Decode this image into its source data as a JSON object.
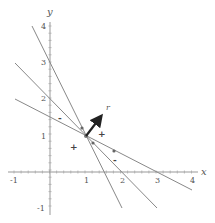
{
  "diagram": {
    "type": "coordinate-plane",
    "axes": {
      "x_label": "x",
      "y_label": "y",
      "x_ticks": [
        "-1",
        "1",
        "2",
        "3",
        "4"
      ],
      "y_ticks": [
        "4",
        "3",
        "2",
        "1",
        "-1"
      ],
      "xlim": [
        -1,
        4
      ],
      "ylim": [
        -1,
        4
      ]
    },
    "lines": [
      {
        "name": "steep-line",
        "from": [
          -0.5,
          4
        ],
        "to": [
          2,
          -1
        ],
        "color": "#888888"
      },
      {
        "name": "middle-line",
        "from": [
          -1,
          3
        ],
        "to": [
          3,
          -1
        ],
        "color": "#888888"
      },
      {
        "name": "shallow-line",
        "from": [
          -1,
          2
        ],
        "to": [
          4,
          -0.5
        ],
        "color": "#888888"
      }
    ],
    "common_point": [
      1,
      1
    ],
    "vector": {
      "label": "r",
      "from": [
        1,
        1
      ],
      "to": [
        1.45,
        1.55
      ],
      "color": "#222222"
    },
    "signs": [
      {
        "symbol": "-",
        "pos": [
          0.3,
          1.5
        ]
      },
      {
        "symbol": "+",
        "pos": [
          1.45,
          1.05
        ]
      },
      {
        "symbol": "+",
        "pos": [
          0.65,
          0.7
        ]
      },
      {
        "symbol": "-",
        "pos": [
          1.8,
          0.35
        ]
      }
    ],
    "markers": [
      {
        "pos": [
          0.9,
          1.2
        ]
      },
      {
        "pos": [
          1.2,
          0.8
        ]
      },
      {
        "pos": [
          1.8,
          0.6
        ]
      }
    ]
  }
}
